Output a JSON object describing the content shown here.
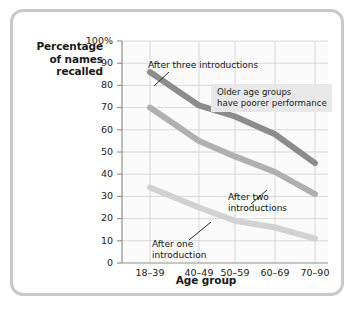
{
  "figure": {
    "card_name": "line-chart-figure"
  },
  "axes": {
    "y_title": "Percentage\nof names\nrecalled",
    "y_title_lines": [
      "Percentage",
      "of names",
      "recalled"
    ],
    "x_title": "Age group",
    "y_ticks": [
      "100%",
      "90",
      "80",
      "70",
      "60",
      "50",
      "40",
      "30",
      "20",
      "10",
      "0"
    ],
    "x_ticks": [
      "18–39",
      "40–49",
      "50–59",
      "60–69",
      "70–90"
    ]
  },
  "annotations": {
    "callout": {
      "line1": "Older age groups",
      "line2": "have poorer performance",
      "background": "#e8e8e8"
    },
    "series_labels": {
      "three": "After three introductions",
      "two_line1": "After two",
      "two_line2": "introductions",
      "one_line1": "After one",
      "one_line2": "introduction"
    }
  },
  "colors": {
    "series_three": "#8c8c8c",
    "series_two": "#b0b0b0",
    "series_one": "#d2d2d2",
    "grid": "#cfcfcf",
    "axis": "#8f8f8f",
    "plot_background": "#fbfbfb",
    "card_border": "#c9c9c9",
    "text": "#1a1a1a"
  },
  "chart_data": {
    "type": "line",
    "title": "",
    "xlabel": "Age group",
    "ylabel": "Percentage of names recalled",
    "categories": [
      "18–39",
      "40–49",
      "50–59",
      "60–69",
      "70–90"
    ],
    "ylim": [
      0,
      100
    ],
    "xlim_note": "categorical, unevenly spaced gridlines",
    "grid": true,
    "legend": "inline labels on plot",
    "yticks": [
      0,
      10,
      20,
      30,
      40,
      50,
      60,
      70,
      80,
      90,
      100
    ],
    "series": [
      {
        "name": "After three introductions",
        "color": "#8c8c8c",
        "values": [
          86,
          71,
          66,
          58,
          45
        ]
      },
      {
        "name": "After two introductions",
        "color": "#b0b0b0",
        "values": [
          70,
          55,
          48,
          41,
          31
        ]
      },
      {
        "name": "After one introduction",
        "color": "#d2d2d2",
        "values": [
          34,
          25,
          19,
          16,
          11
        ]
      }
    ],
    "annotations": [
      {
        "text": "Older age groups have poorer performance",
        "kind": "text-box"
      },
      {
        "text": "After three introductions",
        "kind": "series-callout",
        "series": "After three introductions"
      },
      {
        "text": "After two introductions",
        "kind": "series-callout",
        "series": "After two introductions"
      },
      {
        "text": "After one introduction",
        "kind": "series-callout",
        "series": "After one introduction"
      }
    ]
  }
}
